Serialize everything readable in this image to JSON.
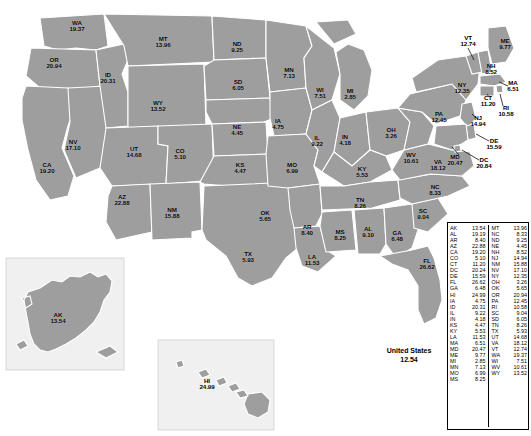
{
  "figure": {
    "total_label": "United States",
    "total_value": "12.54"
  },
  "chart_data": {
    "type": "map",
    "title": "United States",
    "subtitle": "",
    "value_format": "2-decimal rate",
    "national_value": 12.54,
    "legend_position": "bottom-right",
    "grid": false,
    "regions": [
      {
        "code": "AK",
        "value": "13.54",
        "x": 58,
        "y": 318
      },
      {
        "code": "AL",
        "value": "9.10",
        "x": 368,
        "y": 232
      },
      {
        "code": "AR",
        "value": "8.40",
        "x": 307,
        "y": 230
      },
      {
        "code": "AZ",
        "value": "22.88",
        "x": 122,
        "y": 200
      },
      {
        "code": "CA",
        "value": "19.20",
        "x": 47,
        "y": 168
      },
      {
        "code": "CO",
        "value": "5.10",
        "x": 180,
        "y": 154
      },
      {
        "code": "CT",
        "value": "11.20",
        "x": 488,
        "y": 101
      },
      {
        "code": "DC",
        "value": "20.84",
        "x": 484,
        "y": 163
      },
      {
        "code": "DE",
        "value": "15.59",
        "x": 494,
        "y": 144
      },
      {
        "code": "FL",
        "value": "26.62",
        "x": 427,
        "y": 264
      },
      {
        "code": "GA",
        "value": "6.48",
        "x": 397,
        "y": 236
      },
      {
        "code": "HI",
        "value": "24.99",
        "x": 207,
        "y": 384
      },
      {
        "code": "IA",
        "value": "4.75",
        "x": 278,
        "y": 124
      },
      {
        "code": "ID",
        "value": "20.31",
        "x": 108,
        "y": 78
      },
      {
        "code": "IL",
        "value": "9.22",
        "x": 317,
        "y": 141
      },
      {
        "code": "IN",
        "value": "4.18",
        "x": 345,
        "y": 140
      },
      {
        "code": "KS",
        "value": "4.47",
        "x": 240,
        "y": 168
      },
      {
        "code": "KY",
        "value": "5.53",
        "x": 362,
        "y": 172
      },
      {
        "code": "LA",
        "value": "11.53",
        "x": 312,
        "y": 260
      },
      {
        "code": "MA",
        "value": "6.51",
        "x": 513,
        "y": 86
      },
      {
        "code": "MD",
        "value": "20.47",
        "x": 455,
        "y": 160
      },
      {
        "code": "ME",
        "value": "9.77",
        "x": 505,
        "y": 44
      },
      {
        "code": "MI",
        "value": "2.85",
        "x": 350,
        "y": 94
      },
      {
        "code": "MN",
        "value": "7.13",
        "x": 289,
        "y": 73
      },
      {
        "code": "MO",
        "value": "6.99",
        "x": 292,
        "y": 168
      },
      {
        "code": "MS",
        "value": "8.25",
        "x": 340,
        "y": 235
      },
      {
        "code": "MT",
        "value": "13.96",
        "x": 163,
        "y": 42
      },
      {
        "code": "NC",
        "value": "8.33",
        "x": 435,
        "y": 190
      },
      {
        "code": "ND",
        "value": "9.25",
        "x": 237,
        "y": 47
      },
      {
        "code": "NE",
        "value": "4.45",
        "x": 237,
        "y": 130
      },
      {
        "code": "NH",
        "value": "8.52",
        "x": 491,
        "y": 69
      },
      {
        "code": "NJ",
        "value": "14.94",
        "x": 478,
        "y": 121
      },
      {
        "code": "NM",
        "value": "15.88",
        "x": 172,
        "y": 213
      },
      {
        "code": "NV",
        "value": "17.10",
        "x": 73,
        "y": 145
      },
      {
        "code": "NY",
        "value": "12.35",
        "x": 462,
        "y": 88
      },
      {
        "code": "OH",
        "value": "3.26",
        "x": 391,
        "y": 133
      },
      {
        "code": "OK",
        "value": "5.65",
        "x": 265,
        "y": 216
      },
      {
        "code": "OR",
        "value": "20.94",
        "x": 54,
        "y": 63
      },
      {
        "code": "PA",
        "value": "12.45",
        "x": 439,
        "y": 117
      },
      {
        "code": "RI",
        "value": "10.58",
        "x": 506,
        "y": 111
      },
      {
        "code": "SC",
        "value": "9.04",
        "x": 423,
        "y": 214
      },
      {
        "code": "SD",
        "value": "6.05",
        "x": 238,
        "y": 85
      },
      {
        "code": "TN",
        "value": "8.26",
        "x": 360,
        "y": 203
      },
      {
        "code": "TX",
        "value": "5.93",
        "x": 248,
        "y": 257
      },
      {
        "code": "UT",
        "value": "14.68",
        "x": 134,
        "y": 152
      },
      {
        "code": "VA",
        "value": "18.12",
        "x": 438,
        "y": 165
      },
      {
        "code": "VT",
        "value": "12.74",
        "x": 468,
        "y": 41
      },
      {
        "code": "WA",
        "value": "19.37",
        "x": 77,
        "y": 26
      },
      {
        "code": "WI",
        "value": "7.51",
        "x": 320,
        "y": 93
      },
      {
        "code": "WV",
        "value": "10.61",
        "x": 411,
        "y": 158
      },
      {
        "code": "WY",
        "value": "13.52",
        "x": 158,
        "y": 106
      }
    ],
    "legend_table": {
      "column_left": [
        {
          "code": "AK",
          "value": "13.54"
        },
        {
          "code": "AL",
          "value": "19.19"
        },
        {
          "code": "AR",
          "value": "8.40"
        },
        {
          "code": "AZ",
          "value": "22.88"
        },
        {
          "code": "CA",
          "value": "19.20"
        },
        {
          "code": "CO",
          "value": "5.10"
        },
        {
          "code": "CT",
          "value": "11.20"
        },
        {
          "code": "DC",
          "value": "20.24"
        },
        {
          "code": "DE",
          "value": "15.59"
        },
        {
          "code": "FL",
          "value": "26.62"
        },
        {
          "code": "GA",
          "value": "6.48"
        },
        {
          "code": "HI",
          "value": "24.99"
        },
        {
          "code": "IA",
          "value": "4.75"
        },
        {
          "code": "ID",
          "value": "20.31"
        },
        {
          "code": "IL",
          "value": "9.22"
        },
        {
          "code": "IN",
          "value": "4.18"
        },
        {
          "code": "KS",
          "value": "4.47"
        },
        {
          "code": "KY",
          "value": "5.53"
        },
        {
          "code": "LA",
          "value": "11.53"
        },
        {
          "code": "MA",
          "value": "6.51"
        },
        {
          "code": "MD",
          "value": "20.47"
        },
        {
          "code": "ME",
          "value": "9.77"
        },
        {
          "code": "MI",
          "value": "2.85"
        },
        {
          "code": "MN",
          "value": "7.13"
        },
        {
          "code": "MO",
          "value": "6.99"
        },
        {
          "code": "MS",
          "value": "8.25"
        }
      ],
      "column_right": [
        {
          "code": "MT",
          "value": "13.96"
        },
        {
          "code": "NC",
          "value": "8.33"
        },
        {
          "code": "ND",
          "value": "9.25"
        },
        {
          "code": "NE",
          "value": "4.45"
        },
        {
          "code": "NH",
          "value": "8.52"
        },
        {
          "code": "NJ",
          "value": "14.94"
        },
        {
          "code": "NM",
          "value": "15.88"
        },
        {
          "code": "NV",
          "value": "17.10"
        },
        {
          "code": "NY",
          "value": "12.35"
        },
        {
          "code": "OH",
          "value": "3.26"
        },
        {
          "code": "OK",
          "value": "5.65"
        },
        {
          "code": "OR",
          "value": "20.94"
        },
        {
          "code": "PA",
          "value": "12.45"
        },
        {
          "code": "RI",
          "value": "10.58"
        },
        {
          "code": "SC",
          "value": "9.04"
        },
        {
          "code": "SD",
          "value": "6.05"
        },
        {
          "code": "TN",
          "value": "8.26"
        },
        {
          "code": "TX",
          "value": "5.93"
        },
        {
          "code": "UT",
          "value": "14.68"
        },
        {
          "code": "VA",
          "value": "18.12"
        },
        {
          "code": "VT",
          "value": "12.74"
        },
        {
          "code": "WA",
          "value": "19.37"
        },
        {
          "code": "WI",
          "value": "7.51"
        },
        {
          "code": "WV",
          "value": "10.61"
        },
        {
          "code": "WY",
          "value": "13.52"
        }
      ]
    },
    "colors": {
      "land": "#9e9e9e",
      "border": "#ffffff",
      "background": "#ffffff",
      "text": "#000000",
      "inset_background": "#f0f0f0"
    }
  }
}
